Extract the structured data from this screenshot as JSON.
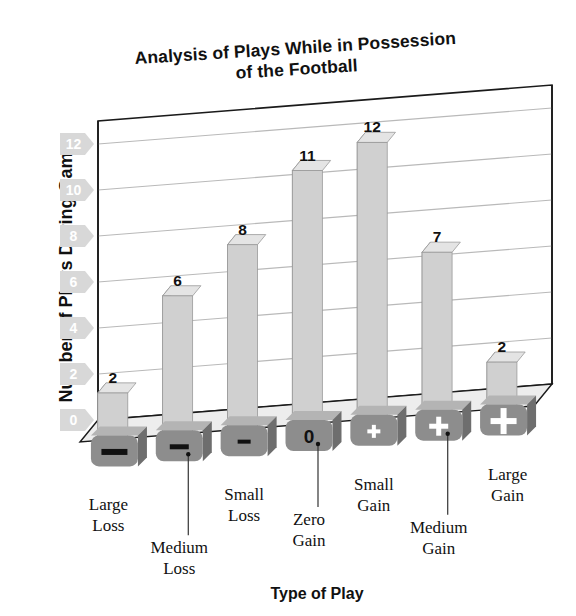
{
  "title": {
    "line1": "Analysis of Plays While in Possession",
    "line2": "of the Football"
  },
  "axes": {
    "y_title": "Number of Plays During Game",
    "x_title": "Type of Play"
  },
  "colors": {
    "bar_front": "#d0d0d0",
    "bar_side": "#a8a8a8",
    "bar_top": "#e4e4e4",
    "tile_front": "#8d8d8d",
    "tile_top": "#b4b4b4",
    "tile_side": "#6e6e6e",
    "ytag": "#d8d8d8",
    "grid": "#b9b9b9",
    "axis": "#1a1a1a",
    "floor": "#ededed",
    "text": "#111111"
  },
  "chart_data": {
    "type": "bar",
    "title": "Analysis of Plays While in Possession of the Football",
    "xlabel": "Type of Play",
    "ylabel": "Number of Plays During Game",
    "categories": [
      "Large Loss",
      "Medium Loss",
      "Small Loss",
      "Zero Gain",
      "Small Gain",
      "Medium Gain",
      "Large Gain"
    ],
    "values": [
      2,
      6,
      8,
      11,
      12,
      7,
      2
    ],
    "ylim": [
      0,
      13
    ],
    "yticks": [
      0,
      2,
      4,
      6,
      8,
      10,
      12
    ],
    "ytick_labels": [
      "0",
      "2",
      "4",
      "6",
      "8",
      "10",
      "12"
    ],
    "grid": true,
    "legend": "none",
    "style": "3d-column",
    "category_glyphs": [
      "minus-large",
      "minus-medium",
      "minus-small",
      "zero",
      "plus-small",
      "plus-medium",
      "plus-large"
    ],
    "category_glyph_text": [
      "—",
      "–",
      "–",
      "0",
      "+",
      "+",
      "+"
    ]
  }
}
